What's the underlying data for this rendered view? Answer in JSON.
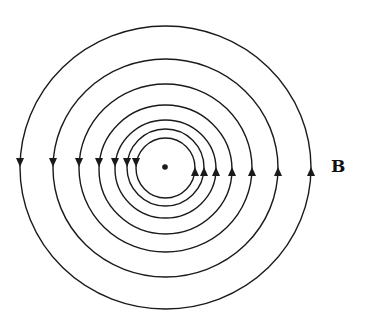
{
  "figure": {
    "type": "magnetic field lines around a current-carrying wire (current out of page)",
    "field_label": "B",
    "center_dot": {
      "cx": 165,
      "cy": 167,
      "r": 2.8
    },
    "line_color": "#1a1a1a",
    "rings": [
      {
        "cx": 166,
        "cy": 168,
        "left": 136,
        "right": 195,
        "top": 138,
        "bottom": 198
      },
      {
        "cx": 166,
        "cy": 168,
        "left": 127,
        "right": 204,
        "top": 129,
        "bottom": 206
      },
      {
        "cx": 166,
        "cy": 169,
        "left": 115,
        "right": 216,
        "top": 120,
        "bottom": 218
      },
      {
        "cx": 166,
        "cy": 169,
        "left": 99,
        "right": 232,
        "top": 105,
        "bottom": 234
      },
      {
        "cx": 166,
        "cy": 169,
        "left": 79,
        "right": 252,
        "top": 84,
        "bottom": 252
      },
      {
        "cx": 166,
        "cy": 168,
        "left": 53,
        "right": 278,
        "top": 59,
        "bottom": 277
      },
      {
        "cx": 166,
        "cy": 167,
        "left": 20,
        "right": 311,
        "top": 26,
        "bottom": 309
      }
    ],
    "arrow_direction": "counterclockwise",
    "left_arrows_y": 162,
    "right_arrows_y": 172
  }
}
